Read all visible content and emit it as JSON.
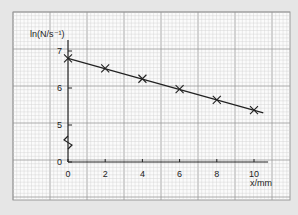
{
  "chart_data": {
    "type": "line",
    "title": "",
    "xlabel": "x/mm",
    "ylabel": "ln(N/s⁻¹)",
    "x": [
      0,
      2,
      4,
      6,
      8,
      10
    ],
    "series": [
      {
        "name": "ln(N/s⁻¹)",
        "values": [
          6.8,
          6.53,
          6.25,
          5.97,
          5.68,
          5.4
        ],
        "marker": "x",
        "line": "best-fit straight line"
      }
    ],
    "x_ticks": [
      "0",
      "2",
      "4",
      "6",
      "8",
      "10"
    ],
    "y_ticks": [
      "0",
      "5",
      "6",
      "7"
    ],
    "xlim": [
      0,
      10.5
    ],
    "ylim": [
      0,
      7.3
    ],
    "y_axis_break": "between 0 and 5",
    "grid": "graph paper (minor and major gridlines)",
    "colors": {
      "paper": "#fbfbfb",
      "minor_grid": "#cfcfcf",
      "major_grid": "#9a9a9a",
      "ink": "#222222",
      "background": "#e6e6e6"
    }
  }
}
